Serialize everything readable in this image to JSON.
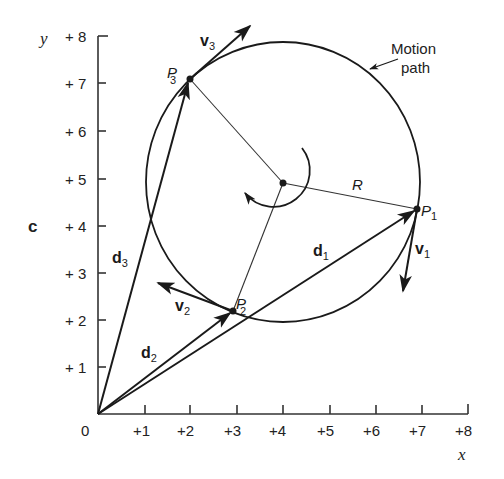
{
  "figure": {
    "panel_letter": "c",
    "x_axis": {
      "name": "x",
      "ticks": [
        "+1",
        "+2",
        "+3",
        "+4",
        "+5",
        "+6",
        "+7",
        "+8"
      ],
      "origin_label": "0"
    },
    "y_axis": {
      "name": "y",
      "ticks": [
        "+ 1",
        "+ 2",
        "+ 3",
        "+ 4",
        "+ 5",
        "+ 6",
        "+ 7",
        "+ 8"
      ]
    },
    "annotations": {
      "motion_path_line1": "Motion",
      "motion_path_line2": "path",
      "radius_label": "R"
    },
    "points": [
      {
        "name": "P",
        "sub": "1",
        "x": 6.9,
        "y": 4.4
      },
      {
        "name": "P",
        "sub": "2",
        "x": 2.9,
        "y": 2.2
      },
      {
        "name": "P",
        "sub": "3",
        "x": 2.0,
        "y": 7.1
      }
    ],
    "center": {
      "x": 4.0,
      "y": 4.9
    },
    "displacements": [
      {
        "name": "d",
        "sub": "1"
      },
      {
        "name": "d",
        "sub": "2"
      },
      {
        "name": "d",
        "sub": "3"
      }
    ],
    "velocities": [
      {
        "name": "v",
        "sub": "1"
      },
      {
        "name": "v",
        "sub": "2"
      },
      {
        "name": "v",
        "sub": "3"
      }
    ],
    "colors": {
      "ink": "#1a1a1a",
      "background": "#ffffff"
    }
  }
}
